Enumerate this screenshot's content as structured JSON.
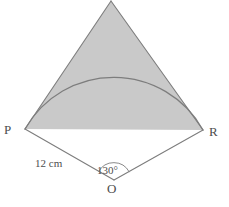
{
  "figure": {
    "type": "geometry-diagram",
    "background_color": "#ffffff",
    "stroke_color": "#808080",
    "shaded_fill_color": "#c9c9c9",
    "text_color": "#4d4d4d",
    "labels": {
      "vertex_p": "P",
      "vertex_r": "R",
      "vertex_o": "O",
      "angle": "130°",
      "radius": "12 cm"
    },
    "geometry": {
      "center_o": [
        114,
        180
      ],
      "point_p": [
        25,
        129
      ],
      "point_r": [
        203,
        130
      ],
      "apex": [
        111,
        1
      ],
      "arc_peak": [
        113,
        85
      ],
      "radius_px": 102,
      "angle_degrees": 130,
      "radius_length_cm": 12,
      "angle_marker_radius_px": 17
    }
  }
}
